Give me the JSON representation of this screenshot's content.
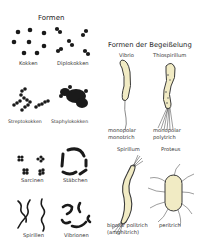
{
  "left_panel": {
    "title": "Formen",
    "shapes": [
      {
        "label": "Kokken"
      },
      {
        "label": "Diplokokken"
      },
      {
        "label": "Streptokokken"
      },
      {
        "label": "Staphylokokken"
      },
      {
        "label": "Sarcinen"
      },
      {
        "label": "Stäbchen"
      },
      {
        "label": "Spirillen"
      },
      {
        "label": "Vibrionen"
      }
    ]
  },
  "right_panel": {
    "title": "Formen der Begeißelung",
    "types": [
      {
        "name": "Vibrio",
        "line1": "monopolar",
        "line2": "monotrich"
      },
      {
        "name": "Thiospirillum",
        "line1": "monopolar",
        "line2": "polytrich"
      },
      {
        "name": "Spirillum",
        "line1": "bipolar politrich",
        "line2": "(amphitrich)"
      },
      {
        "name": "Proteus",
        "line1": "peritrich",
        "line2": ""
      }
    ]
  },
  "colors": {
    "cell_fill": "#f1ebc4",
    "cell_outline": "#3a3a3a",
    "dot": "#1a1a1a"
  }
}
